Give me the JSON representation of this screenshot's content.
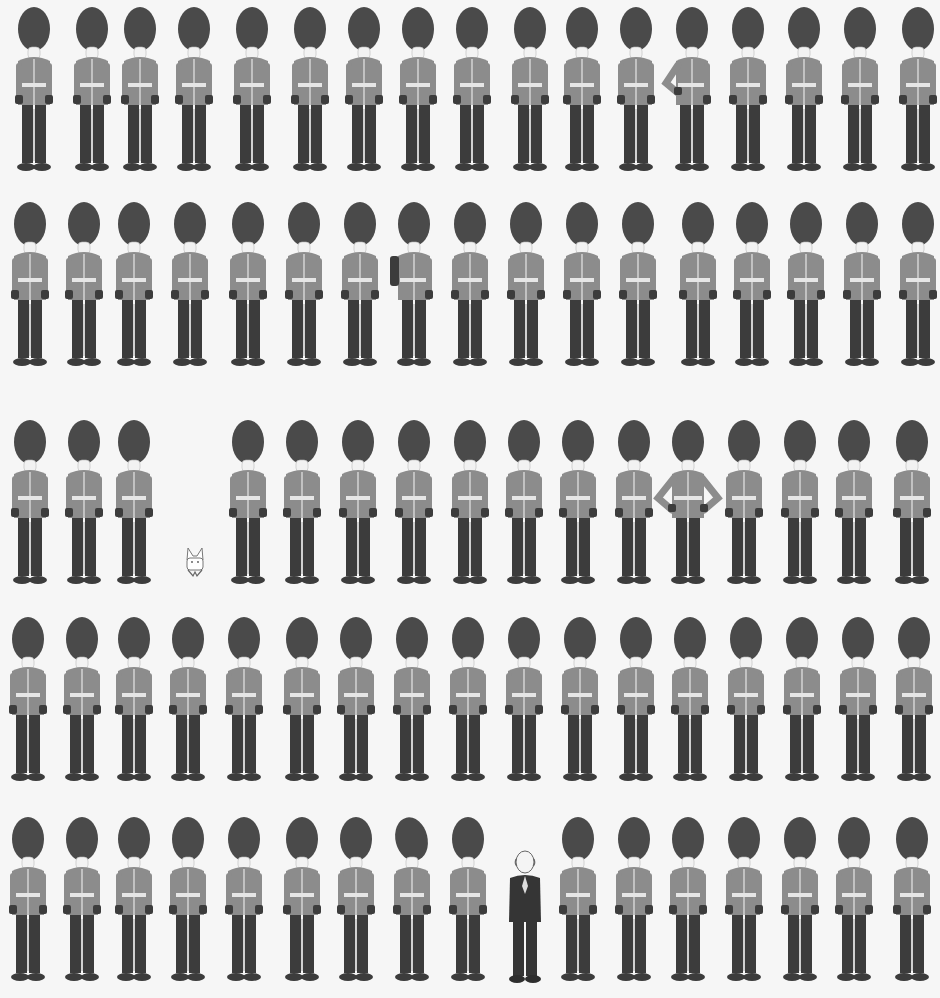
{
  "colors": {
    "background": "#f6f6f6",
    "bearskin": "#4a4a4a",
    "tunic": "#8c8c8c",
    "trousers": "#3c3c3c",
    "belt": "#e6e6e6",
    "skin": "#f2f2f2"
  },
  "rows": [
    {
      "top": 5,
      "xs": [
        12,
        70,
        118,
        172,
        230,
        288,
        342,
        396,
        450,
        508,
        560,
        614,
        670,
        726,
        782,
        838,
        896
      ],
      "variants": {
        "12": "hand-on-hip"
      }
    },
    {
      "top": 200,
      "xs": [
        8,
        62,
        112,
        168,
        226,
        282,
        338,
        392,
        448,
        504,
        560,
        616,
        676,
        730,
        784,
        840,
        896
      ],
      "variants": {
        "7": "saluting"
      }
    },
    {
      "top": 418,
      "xs": [
        8,
        62,
        112,
        226,
        280,
        336,
        392,
        448,
        502,
        556,
        612,
        666,
        722,
        778,
        832,
        890
      ],
      "variants": {
        "11": "hands-on-hips"
      }
    },
    {
      "top": 615,
      "xs": [
        6,
        60,
        112,
        166,
        222,
        280,
        334,
        390,
        446,
        502,
        558,
        614,
        668,
        724,
        780,
        836,
        892
      ],
      "variants": {}
    },
    {
      "top": 815,
      "xs": [
        6,
        60,
        112,
        166,
        222,
        280,
        334,
        390,
        446,
        556,
        612,
        666,
        722,
        778,
        832,
        890
      ],
      "variants": {
        "7": "tilted-hat"
      }
    }
  ],
  "special_figures": {
    "rabbit": {
      "label": "small rabbit",
      "x": 184,
      "y": 546
    },
    "man_in_suit": {
      "label": "bald man in dark suit",
      "x": 505,
      "y": 850
    }
  }
}
